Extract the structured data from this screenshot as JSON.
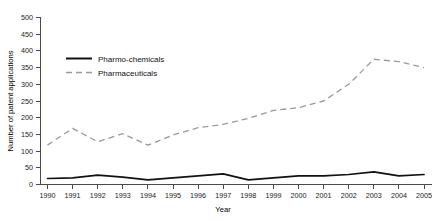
{
  "chart_data": {
    "type": "line",
    "title": "",
    "subtitle": "",
    "xlabel": "Year",
    "ylabel": "Number of patent applications",
    "categories": [
      "1990",
      "1991",
      "1992",
      "1993",
      "1994",
      "1995",
      "1996",
      "1997",
      "1998",
      "1999",
      "2000",
      "2001",
      "2002",
      "2003",
      "2004",
      "2005"
    ],
    "x": [
      1990,
      1991,
      1992,
      1993,
      1994,
      1995,
      1996,
      1997,
      1998,
      1999,
      2000,
      2001,
      2002,
      2003,
      2004,
      2005
    ],
    "xlim": [
      1990,
      2005
    ],
    "ylim": [
      0,
      500
    ],
    "yticks": [
      0,
      50,
      100,
      150,
      200,
      250,
      300,
      350,
      400,
      450,
      500
    ],
    "xticks": [
      "1990",
      "1991",
      "1992",
      "1993",
      "1994",
      "1995",
      "1996",
      "1997",
      "1998",
      "1999",
      "2000",
      "2001",
      "2002",
      "2003",
      "2004",
      "2005"
    ],
    "grid": false,
    "legend_position": "upper-left-inside",
    "series": [
      {
        "name": "Pharmo-chemicals",
        "style": "solid",
        "color": "#111111",
        "values": [
          18,
          20,
          28,
          22,
          14,
          20,
          26,
          32,
          14,
          20,
          26,
          26,
          30,
          38,
          26,
          30
        ]
      },
      {
        "name": "Pharmaceuticals",
        "style": "dashed",
        "color": "#9a9a9a",
        "values": [
          118,
          168,
          128,
          152,
          118,
          148,
          170,
          180,
          198,
          222,
          230,
          250,
          300,
          375,
          368,
          350
        ]
      }
    ]
  },
  "axes": {
    "y_title": "Number of patent applications",
    "x_title": "Year",
    "y_ticks": [
      "500",
      "450",
      "400",
      "350",
      "300",
      "250",
      "200",
      "150",
      "100",
      "50",
      "0"
    ],
    "x_ticks": [
      "1990",
      "1991",
      "1992",
      "1993",
      "1994",
      "1995",
      "1996",
      "1997",
      "1998",
      "1999",
      "2000",
      "2001",
      "2002",
      "2003",
      "2004",
      "2005"
    ]
  },
  "legend": {
    "items": [
      {
        "label": "Pharmo-chemicals",
        "color": "#111111",
        "style": "solid"
      },
      {
        "label": "Pharmaceuticals",
        "color": "#9a9a9a",
        "style": "dashed"
      }
    ]
  }
}
